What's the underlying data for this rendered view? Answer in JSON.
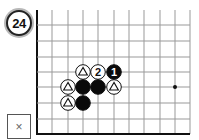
{
  "problem": {
    "number": "24",
    "answer_box_mark": "×"
  },
  "board": {
    "grid": {
      "columns_x": [
        37,
        52,
        68,
        83,
        98,
        114,
        129,
        144,
        160,
        175,
        190
      ],
      "rows_y": [
        25,
        41,
        57,
        72,
        87,
        103,
        119
      ],
      "top_y": 10,
      "bottom_edge_y": 134,
      "left_edge_x": 37,
      "right_x": 190,
      "line_color": "#999999",
      "edge_color": "#111111"
    },
    "hoshi": [
      {
        "x": 175,
        "y": 87
      }
    ],
    "stones": [
      {
        "color": "white",
        "x": 83,
        "y": 72,
        "mark": "triangle",
        "label": ""
      },
      {
        "color": "white",
        "x": 98,
        "y": 72,
        "mark": "number",
        "label": "2"
      },
      {
        "color": "black",
        "x": 114,
        "y": 72,
        "mark": "number",
        "label": "1"
      },
      {
        "color": "white",
        "x": 68,
        "y": 87,
        "mark": "triangle",
        "label": ""
      },
      {
        "color": "black",
        "x": 83,
        "y": 87,
        "mark": "none",
        "label": ""
      },
      {
        "color": "black",
        "x": 98,
        "y": 87,
        "mark": "none",
        "label": ""
      },
      {
        "color": "white",
        "x": 114,
        "y": 87,
        "mark": "triangle",
        "label": ""
      },
      {
        "color": "white",
        "x": 68,
        "y": 103,
        "mark": "triangle",
        "label": ""
      },
      {
        "color": "black",
        "x": 83,
        "y": 103,
        "mark": "none",
        "label": ""
      }
    ]
  }
}
